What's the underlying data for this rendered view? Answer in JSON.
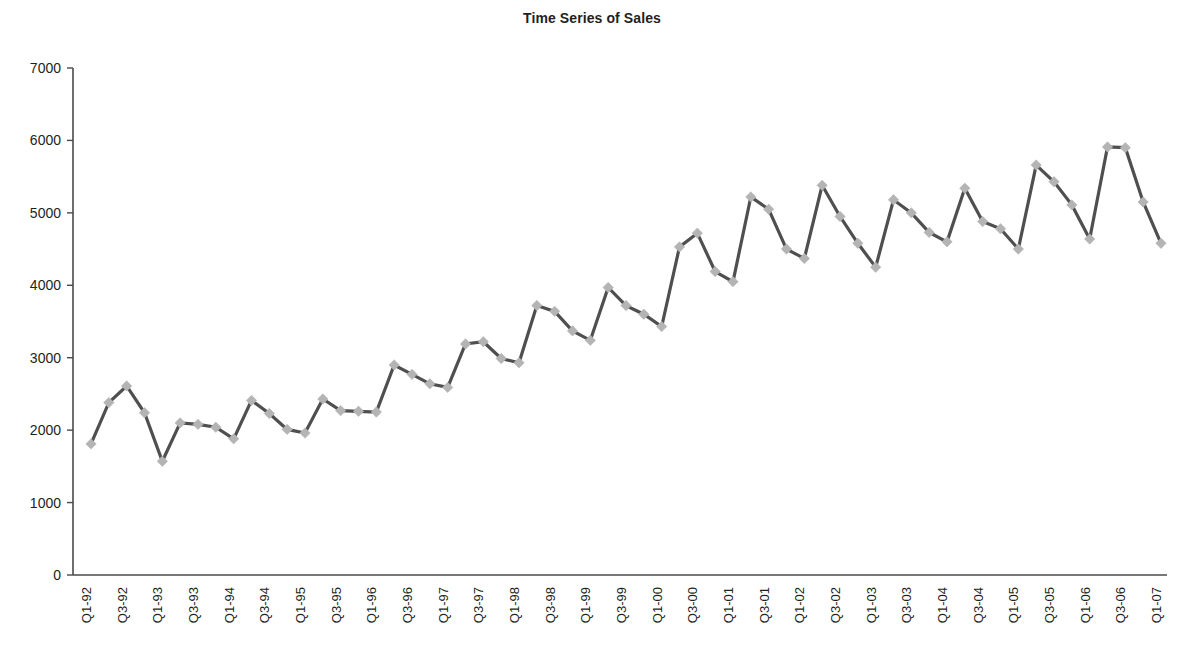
{
  "chart": {
    "title": "Time Series of Sales"
  },
  "chart_data": {
    "type": "line",
    "title": "Time Series of Sales",
    "xlabel": "",
    "ylabel": "",
    "ylim": [
      0,
      7000
    ],
    "ytick_labels": [
      "0",
      "1000",
      "2000",
      "3000",
      "4000",
      "5000",
      "6000",
      "7000"
    ],
    "ytick_values": [
      0,
      1000,
      2000,
      3000,
      4000,
      5000,
      6000,
      7000
    ],
    "grid": false,
    "legend": "none",
    "marker": "diamond",
    "line_color": "#4f4f4f",
    "marker_color": "#b4b4b4",
    "x_tick_label_interval": 2,
    "x_tick_labels": [
      "Q1-92",
      "Q3-92",
      "Q1-93",
      "Q3-93",
      "Q1-94",
      "Q3-94",
      "Q1-95",
      "Q3-95",
      "Q1-96",
      "Q3-96",
      "Q1-97",
      "Q3-97",
      "Q1-98",
      "Q3-98",
      "Q1-99",
      "Q3-99",
      "Q1-00",
      "Q3-00",
      "Q1-01",
      "Q3-01",
      "Q1-02",
      "Q3-02",
      "Q1-03",
      "Q3-03",
      "Q1-04",
      "Q3-04",
      "Q1-05",
      "Q3-05",
      "Q1-06",
      "Q3-06",
      "Q1-07"
    ],
    "categories": [
      "Q1-92",
      "Q2-92",
      "Q3-92",
      "Q4-92",
      "Q1-93",
      "Q2-93",
      "Q3-93",
      "Q4-93",
      "Q1-94",
      "Q2-94",
      "Q3-94",
      "Q4-94",
      "Q1-95",
      "Q2-95",
      "Q3-95",
      "Q4-95",
      "Q1-96",
      "Q2-96",
      "Q3-96",
      "Q4-96",
      "Q1-97",
      "Q2-97",
      "Q3-97",
      "Q4-97",
      "Q1-98",
      "Q2-98",
      "Q3-98",
      "Q4-98",
      "Q1-99",
      "Q2-99",
      "Q3-99",
      "Q4-99",
      "Q1-00",
      "Q2-00",
      "Q3-00",
      "Q4-00",
      "Q1-01",
      "Q2-01",
      "Q3-01",
      "Q4-01",
      "Q1-02",
      "Q2-02",
      "Q3-02",
      "Q4-02",
      "Q1-03",
      "Q2-03",
      "Q3-03",
      "Q4-03",
      "Q1-04",
      "Q2-04",
      "Q3-04",
      "Q4-04",
      "Q1-05",
      "Q2-05",
      "Q3-05",
      "Q4-05",
      "Q1-06",
      "Q2-06",
      "Q3-06",
      "Q4-06",
      "Q1-07"
    ],
    "values": [
      1810,
      2380,
      2610,
      2240,
      1570,
      2100,
      2080,
      2040,
      1880,
      2410,
      2230,
      2010,
      1960,
      2430,
      2270,
      2260,
      2250,
      2900,
      2770,
      2640,
      2590,
      3190,
      3220,
      2990,
      2930,
      3720,
      3640,
      3370,
      3240,
      3970,
      3720,
      3600,
      3430,
      4530,
      4720,
      4190,
      4050,
      5220,
      5050,
      4500,
      4370,
      5380,
      4950,
      4580,
      4250,
      5180,
      5000,
      4730,
      4600,
      5340,
      4880,
      4780,
      4500,
      5660,
      5430,
      5110,
      4640,
      5910,
      5900,
      5150,
      4580
    ]
  }
}
